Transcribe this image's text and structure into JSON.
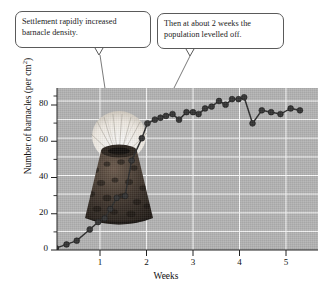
{
  "figure": {
    "name": "barnacle-settlement-graph"
  },
  "callouts": [
    {
      "id": "settlement-callout",
      "line1": "Settlement rapidly increased",
      "line2": "barnacle density."
    },
    {
      "id": "plateau-callout",
      "line1": "Then at about 2 weeks the",
      "line2": "population levelled off."
    }
  ],
  "illustration": {
    "name": "barnacle-photo",
    "caption": "barnacle"
  },
  "chart_data": {
    "type": "line",
    "title": "",
    "xlabel": "Weeks",
    "ylabel": "Number of barnacles (per cm²)",
    "xlim": [
      0,
      5.7
    ],
    "ylim": [
      0,
      92
    ],
    "xticks": [
      1,
      2,
      3,
      4,
      5
    ],
    "xtick_labels": [
      "1",
      "2",
      "3",
      "4",
      "5"
    ],
    "yticks": [
      0,
      20,
      40,
      60,
      80
    ],
    "ytick_labels": [
      "0",
      "20",
      "40",
      "60",
      "80"
    ],
    "y_minor_ticks": [
      10,
      30,
      50,
      70,
      90
    ],
    "grid": true,
    "grid_color": "#ffffff",
    "plot_bg": "#b3b3b3",
    "marker": "circle",
    "marker_color": "#333333",
    "line_color": "#2b2b2b",
    "legend": "none",
    "points": [
      {
        "x": 0.05,
        "y": 1
      },
      {
        "x": 0.28,
        "y": 3
      },
      {
        "x": 0.5,
        "y": 5
      },
      {
        "x": 0.78,
        "y": 11
      },
      {
        "x": 0.96,
        "y": 15
      },
      {
        "x": 1.1,
        "y": 17
      },
      {
        "x": 1.22,
        "y": 22
      },
      {
        "x": 1.36,
        "y": 28
      },
      {
        "x": 1.54,
        "y": 29
      },
      {
        "x": 1.68,
        "y": 48
      },
      {
        "x": 1.9,
        "y": 60
      },
      {
        "x": 2.02,
        "y": 68
      },
      {
        "x": 2.18,
        "y": 70
      },
      {
        "x": 2.3,
        "y": 71
      },
      {
        "x": 2.42,
        "y": 72
      },
      {
        "x": 2.56,
        "y": 73
      },
      {
        "x": 2.7,
        "y": 70
      },
      {
        "x": 2.86,
        "y": 74
      },
      {
        "x": 3.0,
        "y": 74
      },
      {
        "x": 3.12,
        "y": 73
      },
      {
        "x": 3.26,
        "y": 76
      },
      {
        "x": 3.4,
        "y": 77
      },
      {
        "x": 3.56,
        "y": 80
      },
      {
        "x": 3.7,
        "y": 78
      },
      {
        "x": 3.84,
        "y": 81
      },
      {
        "x": 3.98,
        "y": 81
      },
      {
        "x": 4.1,
        "y": 82
      },
      {
        "x": 4.28,
        "y": 68
      },
      {
        "x": 4.48,
        "y": 75
      },
      {
        "x": 4.68,
        "y": 74
      },
      {
        "x": 4.88,
        "y": 73
      },
      {
        "x": 5.1,
        "y": 76
      },
      {
        "x": 5.3,
        "y": 75
      }
    ]
  }
}
